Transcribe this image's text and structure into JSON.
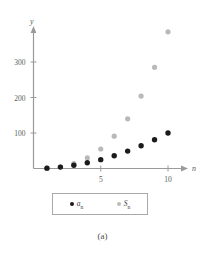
{
  "figure": {
    "caption": "(a)"
  },
  "legend": {
    "position": "below-axes",
    "entries": [
      {
        "label": "a",
        "sub": "n",
        "color": "#1b1b1b",
        "marker": "filled-circle"
      },
      {
        "label": "S",
        "sub": "n",
        "color": "#bcbcbc",
        "marker": "filled-circle"
      }
    ]
  },
  "chart_data": {
    "type": "scatter",
    "title": "",
    "subtitle": "",
    "xlabel": "n",
    "ylabel": "y",
    "xlim": [
      0,
      11
    ],
    "ylim": [
      0,
      400
    ],
    "grid": false,
    "legend_position": "bottom",
    "xticks": [
      5,
      10
    ],
    "xtick_labels": [
      "5",
      "10"
    ],
    "yticks": [
      100,
      200,
      300
    ],
    "ytick_labels": [
      "100",
      "200",
      "300"
    ],
    "x": [
      1,
      2,
      3,
      4,
      5,
      6,
      7,
      8,
      9,
      10
    ],
    "series": [
      {
        "name": "a_n",
        "color": "#1b1b1b",
        "marker": "filled-circle",
        "values": [
          1,
          4,
          9,
          16,
          25,
          36,
          49,
          64,
          81,
          100
        ]
      },
      {
        "name": "S_n",
        "color": "#bcbcbc",
        "marker": "filled-circle",
        "values": [
          1,
          5,
          14,
          30,
          55,
          91,
          140,
          204,
          285,
          385
        ]
      }
    ]
  }
}
